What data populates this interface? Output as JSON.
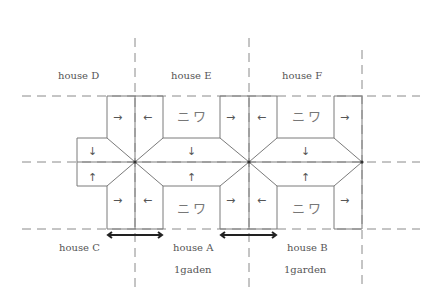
{
  "labels": {
    "house_d": "house D",
    "house_e": "house E",
    "house_f": "house F",
    "house_c": "house C",
    "house_a": "house A",
    "house_b": "house B",
    "garden_a": "1gaden",
    "garden_b": "1garden"
  },
  "courtyard_label": "ニワ",
  "arrows": {
    "right": "→",
    "left": "←",
    "down": "↓",
    "up": "↑"
  },
  "colors": {
    "line": "#7a7a7a",
    "dash": "#8a8a8a",
    "text": "#555555",
    "dimension": "#222222"
  }
}
